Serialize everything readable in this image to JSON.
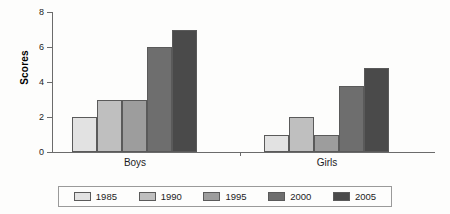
{
  "chart_data": {
    "type": "bar",
    "title": "",
    "xlabel": "",
    "ylabel": "Scores",
    "ylim": [
      0,
      8
    ],
    "yticks": [
      0,
      2,
      4,
      6,
      8
    ],
    "ytick_labels": [
      "0",
      "2",
      "4",
      "6",
      "8"
    ],
    "grid": false,
    "legend_position": "bottom",
    "categories": [
      "Boys",
      "Girls"
    ],
    "series": [
      {
        "name": "1985",
        "color": "#e2e2e2",
        "values": [
          2,
          1
        ]
      },
      {
        "name": "1990",
        "color": "#bfbfbf",
        "values": [
          3,
          2
        ]
      },
      {
        "name": "1995",
        "color": "#9d9d9d",
        "values": [
          3,
          1
        ]
      },
      {
        "name": "2000",
        "color": "#6e6e6e",
        "values": [
          6,
          3.8
        ]
      },
      {
        "name": "2005",
        "color": "#4a4a4a",
        "values": [
          7,
          4.8
        ]
      }
    ]
  },
  "axis": {
    "y_title": "Scores",
    "tick_0": "0",
    "tick_2": "2",
    "tick_4": "4",
    "tick_6": "6",
    "tick_8": "8"
  },
  "groups": {
    "boys_label": "Boys",
    "girls_label": "Girls"
  },
  "legend": {
    "items": [
      {
        "label": "1985",
        "color": "#e2e2e2"
      },
      {
        "label": "1990",
        "color": "#bfbfbf"
      },
      {
        "label": "1995",
        "color": "#9d9d9d"
      },
      {
        "label": "2000",
        "color": "#6e6e6e"
      },
      {
        "label": "2005",
        "color": "#4a4a4a"
      }
    ]
  }
}
